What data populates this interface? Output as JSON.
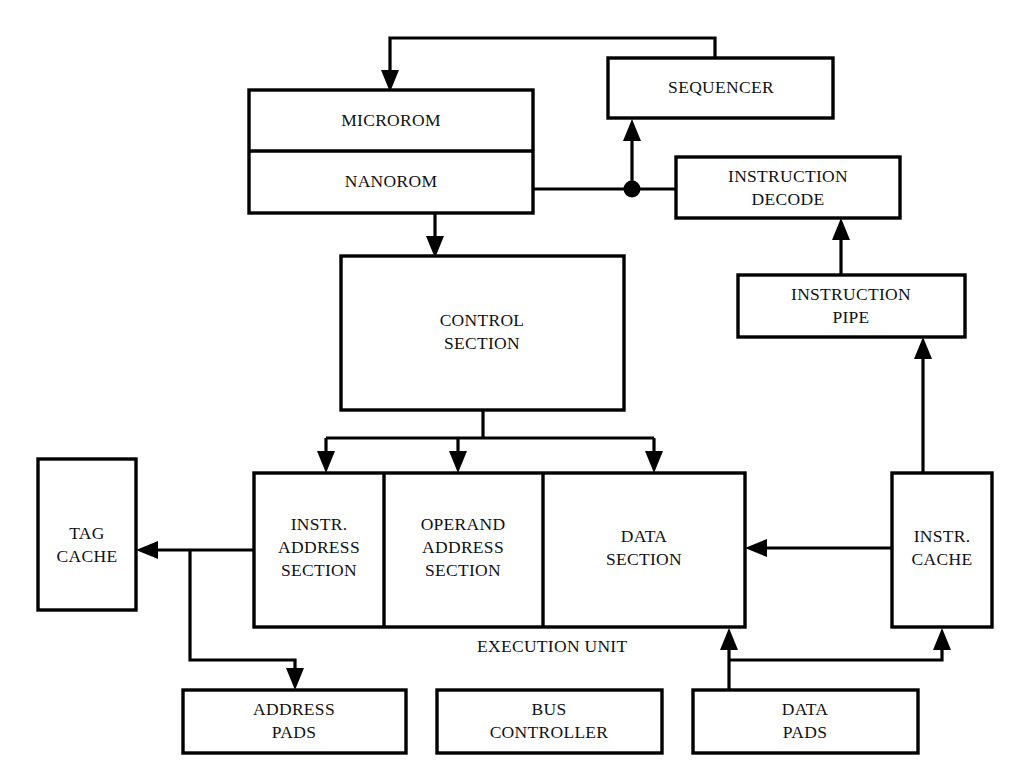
{
  "diagram": {
    "type": "block-diagram",
    "background_color": "#ffffff",
    "line_color": "#000000",
    "text_color": "#111111",
    "blocks": {
      "microrom": {
        "label": "MICROROM"
      },
      "nanorom": {
        "label": "NANOROM"
      },
      "sequencer": {
        "label": "SEQUENCER"
      },
      "instruction_decode": {
        "line1": "INSTRUCTION",
        "line2": "DECODE"
      },
      "instruction_pipe": {
        "line1": "INSTRUCTION",
        "line2": "PIPE"
      },
      "control_section": {
        "line1": "CONTROL",
        "line2": "SECTION"
      },
      "tag_cache": {
        "line1": "TAG",
        "line2": "CACHE"
      },
      "instr_address_section": {
        "line1": "INSTR.",
        "line2": "ADDRESS",
        "line3": "SECTION"
      },
      "operand_address_section": {
        "line1": "OPERAND",
        "line2": "ADDRESS",
        "line3": "SECTION"
      },
      "data_section": {
        "line1": "DATA",
        "line2": "SECTION"
      },
      "instr_cache": {
        "line1": "INSTR.",
        "line2": "CACHE"
      },
      "address_pads": {
        "line1": "ADDRESS",
        "line2": "PADS"
      },
      "bus_controller": {
        "line1": "BUS",
        "line2": "CONTROLLER"
      },
      "data_pads": {
        "line1": "DATA",
        "line2": "PADS"
      },
      "execution_unit": {
        "label": "EXECUTION UNIT"
      }
    },
    "caption": ""
  }
}
